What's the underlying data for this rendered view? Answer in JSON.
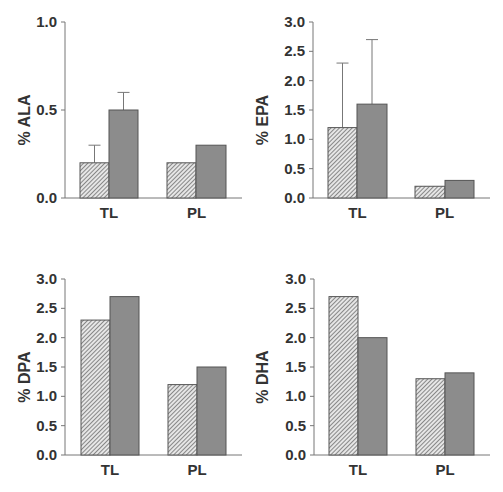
{
  "colors": {
    "hatch_fill": "#e6e6e6",
    "hatch_line": "#555555",
    "solid_fill": "#8c8c8c",
    "bar_stroke": "#555555",
    "axis": "#777777",
    "text": "#333333"
  },
  "chart_data": [
    {
      "type": "bar",
      "title": "",
      "xlabel": "",
      "ylabel": "% ALA",
      "categories": [
        "TL",
        "PL"
      ],
      "series": [
        {
          "name": "hatched",
          "values": [
            0.2,
            0.2
          ],
          "error_upper": [
            0.3,
            null
          ]
        },
        {
          "name": "solid",
          "values": [
            0.5,
            0.3
          ],
          "error_upper": [
            0.6,
            null
          ]
        }
      ],
      "ylim": [
        0,
        1.0
      ],
      "yticks": [
        "0.0",
        "0.5",
        "1.0"
      ],
      "grid": false,
      "legend": null
    },
    {
      "type": "bar",
      "title": "",
      "xlabel": "",
      "ylabel": "% EPA",
      "categories": [
        "TL",
        "PL"
      ],
      "series": [
        {
          "name": "hatched",
          "values": [
            1.2,
            0.2
          ],
          "error_upper": [
            2.3,
            null
          ]
        },
        {
          "name": "solid",
          "values": [
            1.6,
            0.3
          ],
          "error_upper": [
            2.7,
            null
          ]
        }
      ],
      "ylim": [
        0,
        3.0
      ],
      "yticks": [
        "0.0",
        "0.5",
        "1.0",
        "1.5",
        "2.0",
        "2.5",
        "3.0"
      ],
      "grid": false,
      "legend": null
    },
    {
      "type": "bar",
      "title": "",
      "xlabel": "",
      "ylabel": "% DPA",
      "categories": [
        "TL",
        "PL"
      ],
      "series": [
        {
          "name": "hatched",
          "values": [
            2.3,
            1.2
          ],
          "error_upper": [
            null,
            null
          ]
        },
        {
          "name": "solid",
          "values": [
            2.7,
            1.5
          ],
          "error_upper": [
            null,
            null
          ]
        }
      ],
      "ylim": [
        0,
        3.0
      ],
      "yticks": [
        "0.0",
        "0.5",
        "1.0",
        "1.5",
        "2.0",
        "2.5",
        "3.0"
      ],
      "grid": false,
      "legend": null
    },
    {
      "type": "bar",
      "title": "",
      "xlabel": "",
      "ylabel": "% DHA",
      "categories": [
        "TL",
        "PL"
      ],
      "series": [
        {
          "name": "hatched",
          "values": [
            2.7,
            1.3
          ],
          "error_upper": [
            null,
            null
          ]
        },
        {
          "name": "solid",
          "values": [
            2.0,
            1.4
          ],
          "error_upper": [
            null,
            null
          ]
        }
      ],
      "ylim": [
        0,
        3.0
      ],
      "yticks": [
        "0.0",
        "0.5",
        "1.0",
        "1.5",
        "2.0",
        "2.5",
        "3.0"
      ],
      "grid": false,
      "legend": null
    }
  ],
  "layout": {
    "panels": [
      {
        "axis_x": 65,
        "top": 22,
        "base": 198,
        "right": 242,
        "bars": [
          [
            80,
            109
          ],
          [
            109,
            138
          ],
          [
            167,
            196
          ],
          [
            196,
            226
          ]
        ],
        "title_x": 30
      },
      {
        "axis_x": 313,
        "top": 22,
        "base": 198,
        "right": 490,
        "bars": [
          [
            328,
            357
          ],
          [
            357,
            387
          ],
          [
            415,
            445
          ],
          [
            445,
            474
          ]
        ],
        "title_x": 268
      },
      {
        "axis_x": 65,
        "top": 279,
        "base": 455,
        "right": 242,
        "bars": [
          [
            81,
            110
          ],
          [
            110,
            139
          ],
          [
            168,
            197
          ],
          [
            197,
            226
          ]
        ],
        "title_x": 30
      },
      {
        "axis_x": 314,
        "top": 279,
        "base": 455,
        "right": 490,
        "bars": [
          [
            329,
            358
          ],
          [
            358,
            387
          ],
          [
            416,
            445
          ],
          [
            445,
            474
          ]
        ],
        "title_x": 268
      }
    ]
  }
}
